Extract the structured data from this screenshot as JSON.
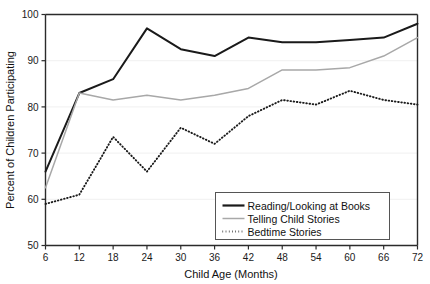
{
  "chart_data": {
    "type": "line",
    "title": "",
    "xlabel": "Child Age (Months)",
    "ylabel": "Percent of Children Participating",
    "x": [
      6,
      12,
      18,
      24,
      30,
      36,
      42,
      48,
      54,
      60,
      66,
      72
    ],
    "xtick_labels": [
      "6",
      "12",
      "18",
      "24",
      "30",
      "36",
      "42",
      "48",
      "54",
      "60",
      "66",
      "72"
    ],
    "ytick_labels": [
      "50",
      "60",
      "70",
      "80",
      "90",
      "100"
    ],
    "yticks": [
      50,
      60,
      70,
      80,
      90,
      100
    ],
    "ylim": [
      50,
      100
    ],
    "xlim": [
      6,
      72
    ],
    "grid": true,
    "legend_position": "lower right",
    "series": [
      {
        "name": "Reading/Looking at Books",
        "style": "solid",
        "color": "#1a1a1a",
        "values": [
          66,
          83,
          86,
          97,
          92.5,
          91,
          95,
          94,
          94,
          94.5,
          95,
          98
        ]
      },
      {
        "name": "Telling Child Stories",
        "style": "solid-light",
        "color": "#a8a8a8",
        "values": [
          62.5,
          83,
          81.5,
          82.5,
          81.5,
          82.5,
          84,
          88,
          88,
          88.5,
          91,
          95
        ]
      },
      {
        "name": "Bedtime Stories",
        "style": "dotted",
        "color": "#1a1a1a",
        "values": [
          59,
          61,
          73.5,
          66,
          75.5,
          72,
          78,
          81.5,
          80.5,
          83.5,
          81.5,
          80.5
        ]
      }
    ]
  },
  "legend": {
    "items": [
      {
        "label": "Reading/Looking at Books"
      },
      {
        "label": "Telling Child Stories"
      },
      {
        "label": "Bedtime Stories"
      }
    ]
  },
  "colors": {
    "series_books": "#1a1a1a",
    "series_telling": "#a8a8a8",
    "series_bedtime": "#1a1a1a",
    "axis": "#2b2b2b",
    "grid": "#f0f0f0",
    "background": "#ffffff"
  }
}
